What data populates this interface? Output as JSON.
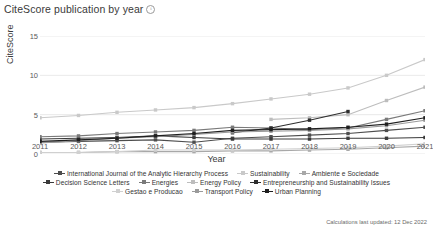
{
  "header": {
    "title": "CiteScore publication by year",
    "info_icon": "info-icon"
  },
  "footer": {
    "note": "Calculations last updated: 12 Dec 2022"
  },
  "chart_data": {
    "type": "line",
    "title": "CiteScore publication by year",
    "xlabel": "Year",
    "ylabel": "CiteScore",
    "x": [
      2011,
      2012,
      2013,
      2014,
      2015,
      2016,
      2017,
      2018,
      2019,
      2020,
      2021
    ],
    "xlim": [
      2011,
      2021
    ],
    "ylim": [
      0,
      15
    ],
    "yticks": [
      0,
      5,
      10,
      15
    ],
    "xticks": [
      "2011",
      "2012",
      "2013",
      "2014",
      "2015",
      "2016",
      "2017",
      "2018",
      "2019",
      "2020",
      "2021"
    ],
    "grid": true,
    "legend_position": "bottom",
    "series": [
      {
        "name": "International Journal of the Analytic Hierarchy Process",
        "color": "#4d4d4d",
        "values": [
          1.5,
          1.6,
          1.7,
          1.8,
          1.5,
          2.0,
          2.2,
          2.4,
          2.6,
          3.0,
          3.4
        ]
      },
      {
        "name": "Sustainability",
        "color": "#c9c9c9",
        "values": [
          4.6,
          4.9,
          5.3,
          5.6,
          5.9,
          6.4,
          7.0,
          7.6,
          8.4,
          10.0,
          12.0
        ]
      },
      {
        "name": "Ambiente e Sociedade",
        "color": "#a8a8a8",
        "values": [
          0.2,
          0.2,
          0.3,
          0.3,
          0.3,
          0.4,
          0.4,
          0.5,
          0.6,
          0.8,
          1.0
        ]
      },
      {
        "name": "Decision Science Letters",
        "color": "#3a3a3a",
        "values": [
          1.9,
          2.0,
          2.1,
          2.3,
          2.1,
          1.9,
          1.9,
          1.9,
          2.0,
          2.0,
          2.1
        ]
      },
      {
        "name": "Energies",
        "color": "#7a7a7a",
        "values": [
          2.2,
          2.3,
          2.6,
          2.8,
          3.0,
          3.4,
          3.3,
          3.1,
          3.3,
          4.4,
          5.5
        ]
      },
      {
        "name": "Energy Policy",
        "color": "#bdbdbd",
        "values": [
          null,
          null,
          null,
          null,
          null,
          null,
          4.4,
          4.6,
          5.0,
          6.8,
          8.5
        ]
      },
      {
        "name": "Entrepreneurship and Sustainability Issues",
        "color": "#2e2e2e",
        "values": [
          null,
          null,
          null,
          null,
          null,
          2.7,
          3.3,
          4.3,
          5.4,
          null,
          null
        ]
      },
      {
        "name": "Gestao e Producao",
        "color": "#d0d0d0",
        "values": [
          0.2,
          0.2,
          0.3,
          0.5,
          0.5,
          0.5,
          0.6,
          0.7,
          0.8,
          1.0,
          1.3
        ]
      },
      {
        "name": "Transport Policy",
        "color": "#9a9a9a",
        "values": [
          1.4,
          1.7,
          2.0,
          2.2,
          2.5,
          2.8,
          2.9,
          3.0,
          3.2,
          3.6,
          4.3
        ]
      },
      {
        "name": "Urban Planning",
        "color": "#1f1f1f",
        "values": [
          1.6,
          1.8,
          2.0,
          2.3,
          2.6,
          3.0,
          3.1,
          3.2,
          3.4,
          3.8,
          4.6
        ]
      }
    ]
  }
}
